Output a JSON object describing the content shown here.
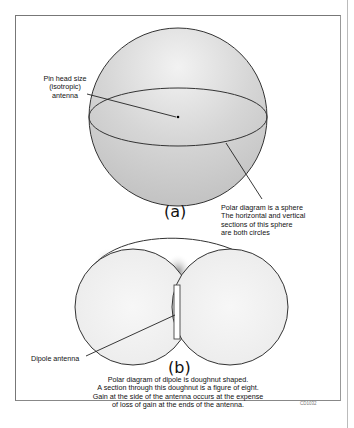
{
  "figure_a": {
    "caption": "(a)",
    "label_pin": [
      "Pin head size",
      "(isotropic)",
      "antenna"
    ],
    "label_sphere": [
      "Polar diagram is a sphere",
      "The horizontal and vertical",
      "sections of this sphere",
      "are both circles"
    ]
  },
  "figure_b": {
    "caption": "(b)",
    "label_dipole": "Dipole antenna",
    "description": [
      "Polar diagram of dipole is doughnut shaped.",
      "A section through this doughnut is a figure of eight.",
      "Gain at the side of the antenna occurs at the expense",
      "of loss of gain at the ends of the antenna."
    ]
  },
  "figure_code": "CD1032",
  "colors": {
    "sphere_fill": "#d4d4d4",
    "outline": "#333333",
    "frame": "#777777"
  }
}
